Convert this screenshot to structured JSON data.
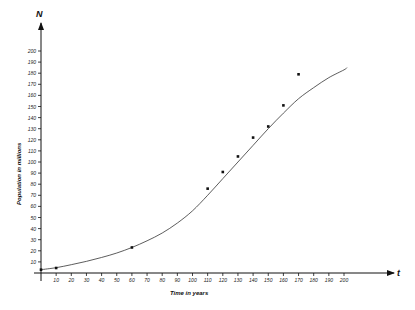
{
  "chart_data": {
    "type": "scatter",
    "title": "",
    "xlabel": "Time in years",
    "ylabel": "Population in millions",
    "x_axis_var": "t",
    "y_axis_var": "N",
    "xlim": [
      0,
      200
    ],
    "ylim": [
      0,
      200
    ],
    "x_ticks": [
      10,
      20,
      30,
      40,
      50,
      60,
      70,
      80,
      90,
      100,
      110,
      120,
      130,
      140,
      150,
      160,
      170,
      180,
      190,
      200
    ],
    "y_ticks": [
      10,
      20,
      30,
      40,
      50,
      60,
      70,
      80,
      90,
      100,
      110,
      120,
      130,
      140,
      150,
      160,
      170,
      180,
      190,
      200
    ],
    "grid": false,
    "legend": null,
    "series": [
      {
        "name": "Observed population",
        "kind": "points",
        "x": [
          0,
          10,
          60,
          110,
          120,
          130,
          140,
          150,
          160,
          170
        ],
        "y": [
          3,
          4.5,
          23,
          76,
          91,
          105,
          122,
          132,
          151,
          179
        ]
      },
      {
        "name": "Logistic fit",
        "kind": "line",
        "x": [
          0,
          10,
          20,
          30,
          40,
          50,
          60,
          70,
          80,
          90,
          100,
          110,
          120,
          130,
          140,
          150,
          160,
          170,
          180,
          190,
          200,
          202
        ],
        "y": [
          3,
          4.8,
          7.5,
          10.5,
          14,
          18,
          23,
          29,
          36,
          45,
          56,
          70,
          85,
          100,
          115,
          130,
          144,
          157,
          167,
          176,
          183,
          185
        ]
      }
    ]
  },
  "colors": {
    "background": "#ffffff",
    "ink": "#111111"
  }
}
